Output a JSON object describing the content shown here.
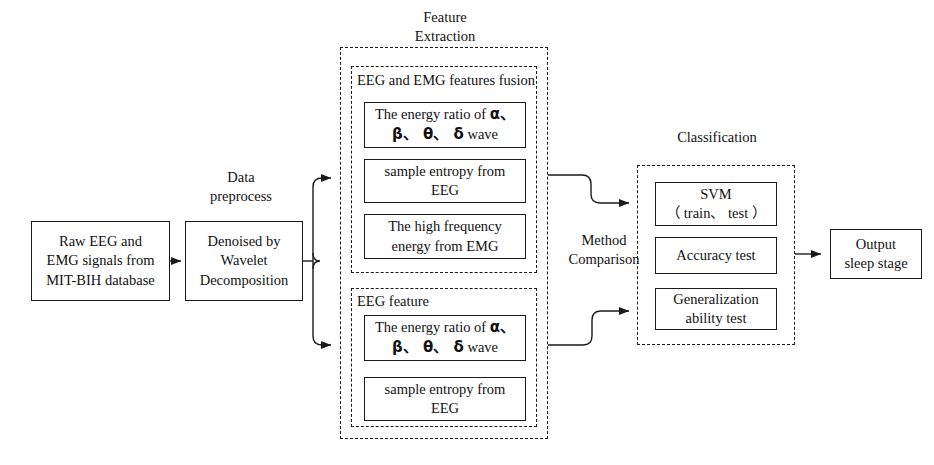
{
  "diagram": {
    "title_present": false,
    "colors": {
      "stroke": "#1a1a1a",
      "background": "#ffffff",
      "text": "#111111"
    }
  },
  "captions": {
    "data_preprocess": "Data\npreprocess",
    "feature_extraction": "Feature\nExtraction",
    "method_comparison": "Method\nComparison",
    "classification": "Classification"
  },
  "nodes": {
    "raw_input": "Raw EEG and\nEMG signals from\nMIT-BIH database",
    "denoise": "Denoised by\nWavelet\nDecomposition",
    "output": "Output\nsleep stage"
  },
  "groups": {
    "fusion": {
      "label": "EEG and EMG features fusion",
      "items": [
        {
          "name": "energy-ratio-fusion",
          "line1": "The energy ratio of ",
          "greek1": "α、",
          "line2_greek": "β、 θ、 δ",
          "line2_tail": " wave"
        },
        {
          "name": "sample-entropy-fusion",
          "text": "sample entropy from\nEEG"
        },
        {
          "name": "high-frequency-emg",
          "text": "The high frequency\nenergy from EMG"
        }
      ]
    },
    "eeg_only": {
      "label": "EEG feature",
      "items": [
        {
          "name": "energy-ratio-eeg",
          "line1": "The energy ratio of ",
          "greek1": "α、",
          "line2_greek": "β、 θ、 δ",
          "line2_tail": " wave"
        },
        {
          "name": "sample-entropy-eeg",
          "text": "sample entropy from\nEEG"
        }
      ]
    },
    "classification": {
      "label": "Classification",
      "items": [
        {
          "name": "svm",
          "text": "SVM\n（ train、 test ）"
        },
        {
          "name": "accuracy-test",
          "text": "Accuracy test"
        },
        {
          "name": "generalization-test",
          "text": "Generalization\nability test"
        }
      ]
    }
  }
}
